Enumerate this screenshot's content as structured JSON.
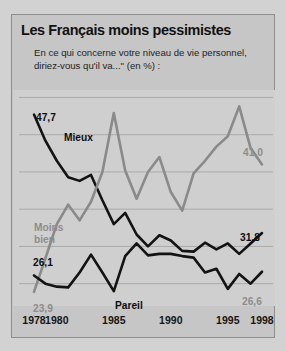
{
  "header": {
    "title": "Les Français moins pessimistes",
    "subtitle_line1": "En ce qui concerne votre niveau de vie personnel,",
    "subtitle_line2": "diriez-vous qu'il va...\" (en %) :"
  },
  "annotations": {
    "start_mieux": "47,7",
    "start_pareil": "26,1",
    "start_moins_bien": "23,9",
    "end_moins_bien": "41,0",
    "end_mieux": "31,8",
    "end_pareil": "26,6",
    "label_mieux": "Mieux",
    "label_moins_bien_l1": "Moins",
    "label_moins_bien_l2": "bien",
    "label_pareil": "Pareil"
  },
  "colors": {
    "series_dark": "#131313",
    "series_gray": "#8a8a8a",
    "frame": "#c6c6c6",
    "plot_bg": "#cfcfcf",
    "grid": "#a6a6a6"
  },
  "chart_data": {
    "type": "line",
    "title": "Les Français moins pessimistes",
    "subtitle": "En ce qui concerne votre niveau de vie personnel, diriez-vous qu'il va...\" (en %) :",
    "xlabel": "",
    "ylabel": "",
    "ylim": [
      22,
      51
    ],
    "xlim": [
      1978,
      1998
    ],
    "grid": true,
    "legend": "inline-labels",
    "yticks": [
      25,
      30,
      35,
      40,
      45,
      50
    ],
    "xticks": [
      1978,
      1980,
      1985,
      1990,
      1995,
      1998
    ],
    "x": [
      1978,
      1979,
      1980,
      1981,
      1982,
      1983,
      1984,
      1985,
      1986,
      1987,
      1988,
      1989,
      1990,
      1991,
      1992,
      1993,
      1994,
      1995,
      1996,
      1997,
      1998
    ],
    "series": [
      {
        "name": "Mieux",
        "color": "#131313",
        "start_label": "47,7",
        "end_label": "31,8",
        "values": [
          47.7,
          44.2,
          41.5,
          39.3,
          38.8,
          39.6,
          36.2,
          33.0,
          34.5,
          31.6,
          30.0,
          31.5,
          30.8,
          29.4,
          29.3,
          30.5,
          29.6,
          30.4,
          29.0,
          30.4,
          31.8
        ]
      },
      {
        "name": "Moins bien",
        "color": "#8a8a8a",
        "start_label": "23,9",
        "end_label": "41,0",
        "values": [
          23.9,
          28.4,
          33.0,
          35.6,
          33.5,
          36.0,
          40.0,
          47.9,
          40.2,
          36.4,
          40.0,
          42.0,
          37.3,
          34.8,
          39.8,
          41.5,
          43.4,
          44.8,
          48.8,
          43.2,
          41.0
        ]
      },
      {
        "name": "Pareil",
        "color": "#131313",
        "start_label": "26,1",
        "end_label": "26,6",
        "values": [
          26.1,
          25.0,
          24.6,
          24.5,
          26.5,
          28.9,
          26.5,
          24.0,
          28.7,
          30.4,
          28.8,
          29.0,
          29.0,
          28.7,
          28.5,
          26.5,
          27.0,
          24.3,
          26.3,
          25.0,
          26.6
        ]
      }
    ]
  }
}
